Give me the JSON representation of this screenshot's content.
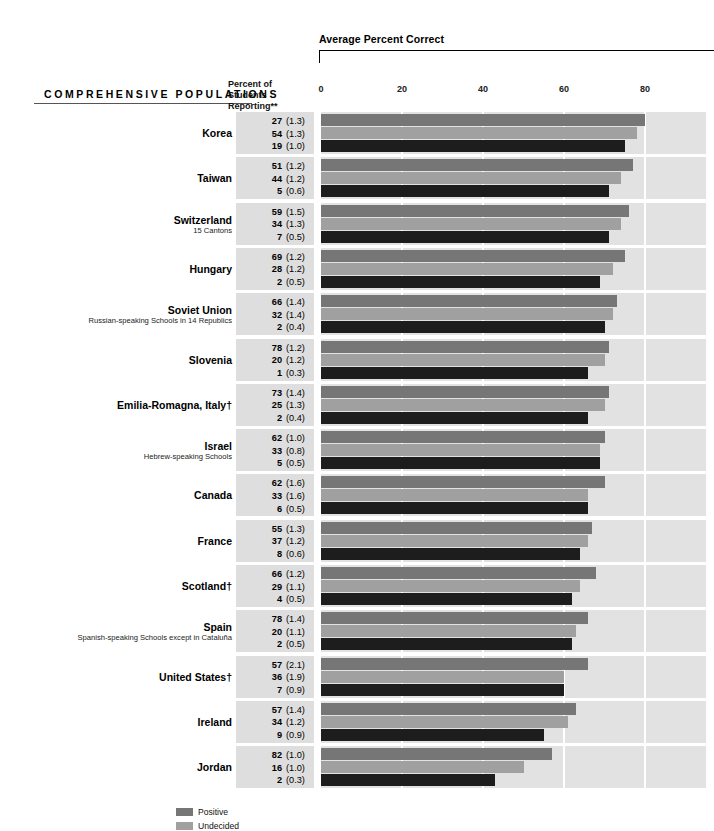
{
  "chart_data": {
    "type": "bar",
    "orientation": "horizontal",
    "title": "Average Percent Correct",
    "section_header": "COMPREHENSIVE POPULATIONS",
    "percent_header_line1": "Percent of",
    "percent_header_line2": "Students Reporting**",
    "xlabel": "",
    "ylabel": "",
    "xlim": [
      0,
      95
    ],
    "ticks": [
      0,
      20,
      40,
      60,
      80
    ],
    "tick_labels": [
      "0",
      "20",
      "40",
      "60",
      "80"
    ],
    "grid": true,
    "legend_position": "bottom",
    "series": [
      {
        "name": "Positive",
        "color": "#767676"
      },
      {
        "name": "Undecided",
        "color": "#a0a0a0"
      },
      {
        "name": "Negative",
        "color": "#1d1d1d"
      }
    ],
    "categories": [
      "Korea",
      "Taiwan",
      "Switzerland",
      "Hungary",
      "Soviet Union",
      "Slovenia",
      "Emilia-Romagna, Italy†",
      "Israel",
      "Canada",
      "France",
      "Scotland†",
      "Spain",
      "United States†",
      "Ireland",
      "Jordan"
    ],
    "rows": [
      {
        "name": "Korea",
        "sub": "",
        "reporting": [
          {
            "value": "27",
            "se": "(1.3)"
          },
          {
            "value": "54",
            "se": "(1.3)"
          },
          {
            "value": "19",
            "se": "(1.0)"
          }
        ],
        "bars": [
          80,
          78,
          75
        ]
      },
      {
        "name": "Taiwan",
        "sub": "",
        "reporting": [
          {
            "value": "51",
            "se": "(1.2)"
          },
          {
            "value": "44",
            "se": "(1.2)"
          },
          {
            "value": "5",
            "se": "(0.6)"
          }
        ],
        "bars": [
          77,
          74,
          71
        ]
      },
      {
        "name": "Switzerland",
        "sub": "15 Cantons",
        "reporting": [
          {
            "value": "59",
            "se": "(1.5)"
          },
          {
            "value": "34",
            "se": "(1.3)"
          },
          {
            "value": "7",
            "se": "(0.5)"
          }
        ],
        "bars": [
          76,
          74,
          71
        ]
      },
      {
        "name": "Hungary",
        "sub": "",
        "reporting": [
          {
            "value": "69",
            "se": "(1.2)"
          },
          {
            "value": "28",
            "se": "(1.2)"
          },
          {
            "value": "2",
            "se": "(0.5)"
          }
        ],
        "bars": [
          75,
          72,
          69
        ]
      },
      {
        "name": "Soviet Union",
        "sub": "Russian-speaking Schools in 14 Republics",
        "reporting": [
          {
            "value": "66",
            "se": "(1.4)"
          },
          {
            "value": "32",
            "se": "(1.4)"
          },
          {
            "value": "2",
            "se": "(0.4)"
          }
        ],
        "bars": [
          73,
          72,
          70
        ]
      },
      {
        "name": "Slovenia",
        "sub": "",
        "reporting": [
          {
            "value": "78",
            "se": "(1.2)"
          },
          {
            "value": "20",
            "se": "(1.2)"
          },
          {
            "value": "1",
            "se": "(0.3)"
          }
        ],
        "bars": [
          71,
          70,
          66
        ]
      },
      {
        "name": "Emilia-Romagna, Italy†",
        "sub": "",
        "reporting": [
          {
            "value": "73",
            "se": "(1.4)"
          },
          {
            "value": "25",
            "se": "(1.3)"
          },
          {
            "value": "2",
            "se": "(0.4)"
          }
        ],
        "bars": [
          71,
          70,
          66
        ]
      },
      {
        "name": "Israel",
        "sub": "Hebrew-speaking Schools",
        "reporting": [
          {
            "value": "62",
            "se": "(1.0)"
          },
          {
            "value": "33",
            "se": "(0.8)"
          },
          {
            "value": "5",
            "se": "(0.5)"
          }
        ],
        "bars": [
          70,
          69,
          69
        ]
      },
      {
        "name": "Canada",
        "sub": "",
        "reporting": [
          {
            "value": "62",
            "se": "(1.6)"
          },
          {
            "value": "33",
            "se": "(1.6)"
          },
          {
            "value": "6",
            "se": "(0.5)"
          }
        ],
        "bars": [
          70,
          66,
          66
        ]
      },
      {
        "name": "France",
        "sub": "",
        "reporting": [
          {
            "value": "55",
            "se": "(1.3)"
          },
          {
            "value": "37",
            "se": "(1.2)"
          },
          {
            "value": "8",
            "se": "(0.6)"
          }
        ],
        "bars": [
          67,
          66,
          64
        ]
      },
      {
        "name": "Scotland†",
        "sub": "",
        "reporting": [
          {
            "value": "66",
            "se": "(1.2)"
          },
          {
            "value": "29",
            "se": "(1.1)"
          },
          {
            "value": "4",
            "se": "(0.5)"
          }
        ],
        "bars": [
          68,
          64,
          62
        ]
      },
      {
        "name": "Spain",
        "sub": "Spanish-speaking Schools except in Cataluña",
        "reporting": [
          {
            "value": "78",
            "se": "(1.4)"
          },
          {
            "value": "20",
            "se": "(1.1)"
          },
          {
            "value": "2",
            "se": "(0.5)"
          }
        ],
        "bars": [
          66,
          63,
          62
        ]
      },
      {
        "name": "United States†",
        "sub": "",
        "reporting": [
          {
            "value": "57",
            "se": "(2.1)"
          },
          {
            "value": "36",
            "se": "(1.9)"
          },
          {
            "value": "7",
            "se": "(0.9)"
          }
        ],
        "bars": [
          66,
          60,
          60
        ]
      },
      {
        "name": "Ireland",
        "sub": "",
        "reporting": [
          {
            "value": "57",
            "se": "(1.4)"
          },
          {
            "value": "34",
            "se": "(1.2)"
          },
          {
            "value": "9",
            "se": "(0.9)"
          }
        ],
        "bars": [
          63,
          61,
          55
        ]
      },
      {
        "name": "Jordan",
        "sub": "",
        "reporting": [
          {
            "value": "82",
            "se": "(1.0)"
          },
          {
            "value": "16",
            "se": "(1.0)"
          },
          {
            "value": "2",
            "se": "(0.3)"
          }
        ],
        "bars": [
          57,
          50,
          43
        ]
      }
    ],
    "legend": [
      {
        "label": "Positive",
        "color": "#767676"
      },
      {
        "label": "Undecided",
        "color": "#a0a0a0"
      }
    ]
  }
}
